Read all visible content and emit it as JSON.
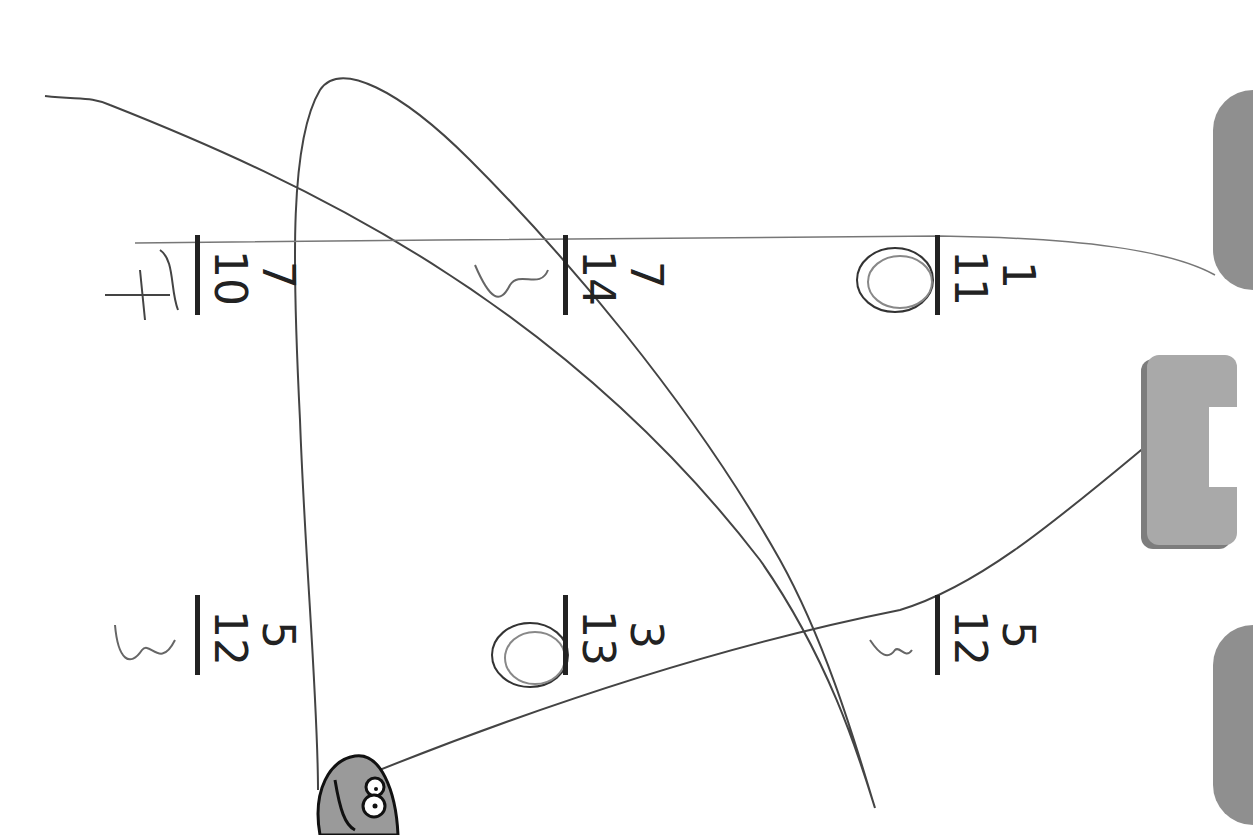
{
  "worksheet": {
    "orientation": "rotated 90deg clockwise",
    "problems": [
      {
        "id": "p1",
        "numerator": "7",
        "denominator": "10",
        "handwritten": "4"
      },
      {
        "id": "p2",
        "numerator": "7",
        "denominator": "14",
        "handwritten": "3"
      },
      {
        "id": "p3",
        "numerator": "1",
        "denominator": "11",
        "handwritten": "0"
      },
      {
        "id": "p4",
        "numerator": "5",
        "denominator": "12",
        "handwritten": "3"
      },
      {
        "id": "p5",
        "numerator": "3",
        "denominator": "13",
        "handwritten": "0"
      },
      {
        "id": "p6",
        "numerator": "5",
        "denominator": "12",
        "handwritten": "3"
      }
    ]
  },
  "colors": {
    "ink": "#222222",
    "pencil": "#555555",
    "tab_gray": "#a9a9a9",
    "mascot_gray": "#9a9a9a"
  }
}
